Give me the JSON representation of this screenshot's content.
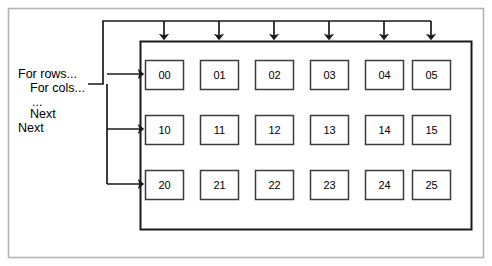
{
  "diagram": {
    "colors": {
      "outer_frame": "#b4b4b4",
      "container_border": "#1a1a1a",
      "cell_border": "#3c3c3c",
      "line": "#1a1a1a",
      "text": "#000000",
      "background": "#ffffff"
    },
    "outer_frame": {
      "x": 8,
      "y": 8,
      "width": 476,
      "height": 250
    },
    "container": {
      "x": 140,
      "y": 41,
      "width": 332,
      "height": 189
    },
    "code_block": {
      "name": "nested-loop-pseudocode",
      "lines": [
        {
          "text": "For rows...",
          "indent": 0
        },
        {
          "text": "For cols...",
          "indent": 1
        },
        {
          "text": "...",
          "indent": 1
        },
        {
          "text": "Next",
          "indent": 1
        },
        {
          "text": "Next",
          "indent": 0
        }
      ]
    },
    "grid": {
      "rows": 3,
      "cols": 6,
      "cell_width": 38,
      "cell_height": 29,
      "col_x": [
        145,
        200,
        255,
        310,
        365,
        412
      ],
      "row_y": [
        60,
        115,
        170
      ],
      "cells": [
        [
          "00",
          "01",
          "02",
          "03",
          "04",
          "05"
        ],
        [
          "10",
          "11",
          "12",
          "13",
          "14",
          "15"
        ],
        [
          "20",
          "21",
          "22",
          "23",
          "24",
          "25"
        ]
      ]
    },
    "column_arrows": {
      "name": "column-iteration-arrows",
      "count": 6,
      "bus_y": 21,
      "bus_x_start": 103,
      "tip_y": 41,
      "x": [
        164,
        219,
        274,
        329,
        384,
        431
      ]
    },
    "row_arrows": {
      "name": "row-iteration-arrows",
      "count": 3,
      "bus_x": 107,
      "bus_y_start": 74,
      "bus_y_end": 184,
      "tip_x": 145,
      "y": [
        74,
        129,
        184
      ]
    },
    "code_connector": {
      "name": "pseudocode-connector",
      "from_x": 88,
      "from_y": 84,
      "corner_x": 103,
      "to_y": 21
    }
  }
}
